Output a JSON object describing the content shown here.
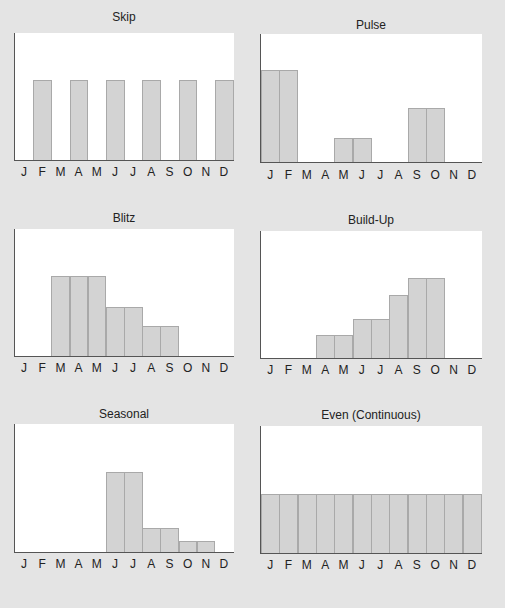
{
  "months": [
    "J",
    "F",
    "M",
    "A",
    "M",
    "J",
    "J",
    "A",
    "S",
    "O",
    "N",
    "D"
  ],
  "panels": [
    {
      "title": "Skip"
    },
    {
      "title": "Pulse"
    },
    {
      "title": "Blitz"
    },
    {
      "title": "Build-Up"
    },
    {
      "title": "Seasonal"
    },
    {
      "title": "Even (Continuous)"
    }
  ],
  "chart_data": [
    {
      "type": "bar",
      "title": "Skip",
      "categories": [
        "J",
        "F",
        "M",
        "A",
        "M",
        "J",
        "J",
        "A",
        "S",
        "O",
        "N",
        "D"
      ],
      "values": [
        0,
        63,
        0,
        63,
        0,
        63,
        0,
        63,
        0,
        63,
        0,
        63
      ],
      "xlabel": "",
      "ylabel": "",
      "ylim": [
        0,
        100
      ],
      "grid": false
    },
    {
      "type": "bar",
      "title": "Pulse",
      "categories": [
        "J",
        "F",
        "M",
        "A",
        "M",
        "J",
        "J",
        "A",
        "S",
        "O",
        "N",
        "D"
      ],
      "values": [
        72,
        72,
        0,
        0,
        19,
        19,
        0,
        0,
        42,
        42,
        0,
        0
      ],
      "xlabel": "",
      "ylabel": "",
      "ylim": [
        0,
        100
      ],
      "grid": false
    },
    {
      "type": "bar",
      "title": "Blitz",
      "categories": [
        "J",
        "F",
        "M",
        "A",
        "M",
        "J",
        "J",
        "A",
        "S",
        "O",
        "N",
        "D"
      ],
      "values": [
        0,
        0,
        63,
        63,
        63,
        39,
        39,
        24,
        24,
        0,
        0,
        0
      ],
      "xlabel": "",
      "ylabel": "",
      "ylim": [
        0,
        100
      ],
      "grid": false
    },
    {
      "type": "bar",
      "title": "Build-Up",
      "categories": [
        "J",
        "F",
        "M",
        "A",
        "M",
        "J",
        "J",
        "A",
        "S",
        "O",
        "N",
        "D"
      ],
      "values": [
        0,
        0,
        0,
        18,
        18,
        31,
        31,
        50,
        63,
        63,
        0,
        0
      ],
      "xlabel": "",
      "ylabel": "",
      "ylim": [
        0,
        100
      ],
      "grid": false
    },
    {
      "type": "bar",
      "title": "Seasonal",
      "categories": [
        "J",
        "F",
        "M",
        "A",
        "M",
        "J",
        "J",
        "A",
        "S",
        "O",
        "N",
        "D"
      ],
      "values": [
        0,
        0,
        0,
        0,
        0,
        63,
        63,
        19,
        19,
        9,
        9,
        0
      ],
      "xlabel": "",
      "ylabel": "",
      "ylim": [
        0,
        100
      ],
      "grid": false
    },
    {
      "type": "bar",
      "title": "Even (Continuous)",
      "categories": [
        "J",
        "F",
        "M",
        "A",
        "M",
        "J",
        "J",
        "A",
        "S",
        "O",
        "N",
        "D"
      ],
      "values": [
        47,
        47,
        47,
        47,
        47,
        47,
        47,
        47,
        47,
        47,
        47,
        47
      ],
      "xlabel": "",
      "ylabel": "",
      "ylim": [
        0,
        100
      ],
      "grid": false
    }
  ],
  "colors": {
    "background": "#e4e4e4",
    "plot_background": "#ffffff",
    "bar_fill": "#d3d3d3",
    "bar_border": "#a9a9a9",
    "axis": "#555555"
  }
}
